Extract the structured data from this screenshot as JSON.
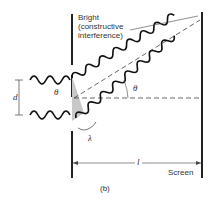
{
  "diagram": {
    "labels": {
      "bright_line1": "Bright",
      "bright_line2": "(constructive",
      "bright_line3": "interference)",
      "slit_separation": "d",
      "angle_at_slit": "θ",
      "angle_at_center": "θ",
      "wavelength": "λ",
      "distance": "l",
      "screen": "Screen",
      "caption": "(b)"
    },
    "colors": {
      "line": "#222222",
      "shade": "#c8c8c8",
      "background": "#ffffff"
    }
  }
}
